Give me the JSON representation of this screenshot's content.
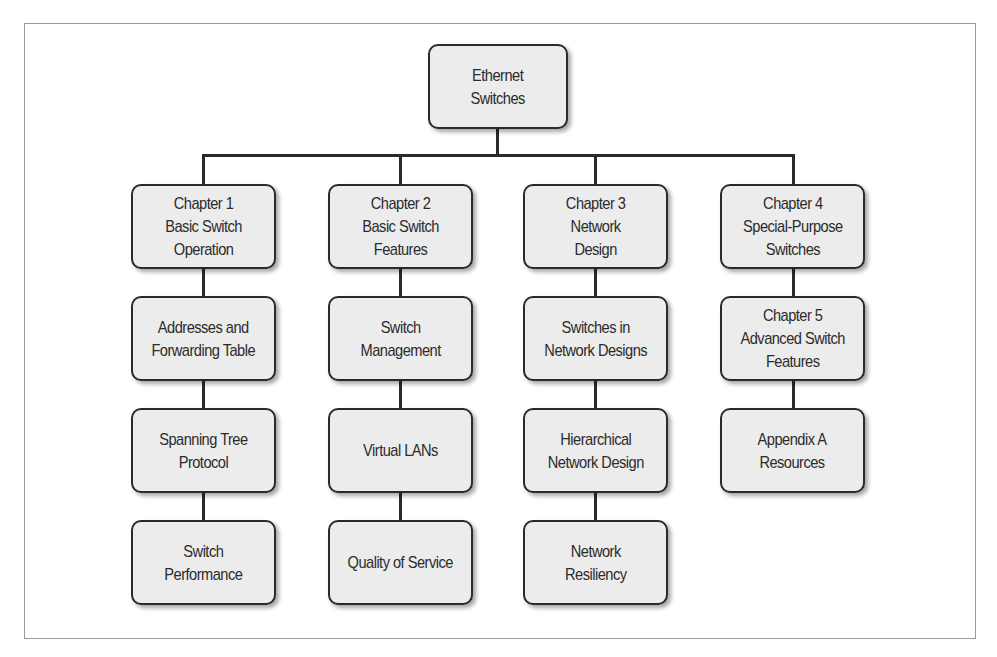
{
  "diagram": {
    "type": "hierarchy",
    "root": {
      "label": "Ethernet\nSwitches"
    },
    "columns": [
      {
        "items": [
          "Chapter 1\nBasic Switch\nOperation",
          "Addresses and\nForwarding Table",
          "Spanning Tree\nProtocol",
          "Switch\nPerformance"
        ]
      },
      {
        "items": [
          "Chapter 2\nBasic Switch\nFeatures",
          "Switch\nManagement",
          "Virtual LANs",
          "Quality of Service"
        ]
      },
      {
        "items": [
          "Chapter 3\nNetwork\nDesign",
          "Switches in\nNetwork Designs",
          "Hierarchical\nNetwork Design",
          "Network\nResiliency"
        ]
      },
      {
        "items": [
          "Chapter 4\nSpecial-Purpose\nSwitches",
          "Chapter 5\nAdvanced Switch\nFeatures",
          "Appendix A\nResources"
        ]
      }
    ],
    "colors": {
      "box_fill": "#ececec",
      "stroke": "#2a2a2a",
      "text": "#2b2b2b",
      "frame": "#9a9a9a"
    }
  }
}
